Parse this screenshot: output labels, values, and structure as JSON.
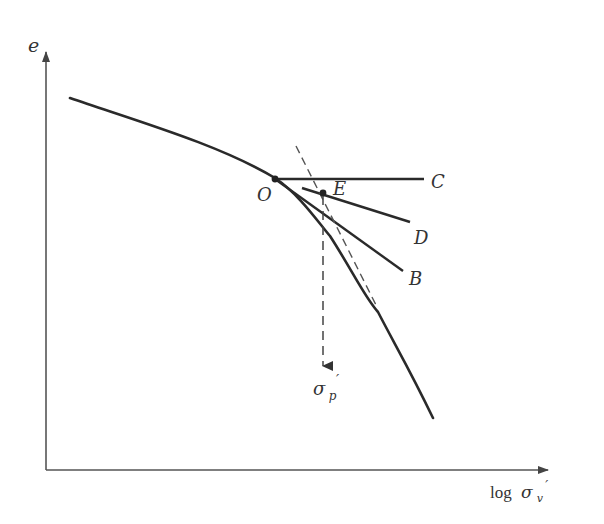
{
  "figure": {
    "colors": {
      "curve": "#2a2a2a",
      "axis": "#555555",
      "dashed": "#555555",
      "label": "#333333"
    },
    "axes": {
      "y_label": "e",
      "x_label_prefix": "log",
      "x_label_symbol": "σ",
      "x_label_subscript": "v",
      "x_label_prime": "′"
    },
    "points": {
      "O": "O",
      "E": "E"
    },
    "lines": {
      "C": "C",
      "D": "D",
      "B": "B"
    },
    "result": {
      "symbol": "σ",
      "subscript": "p",
      "prime": "′"
    }
  }
}
